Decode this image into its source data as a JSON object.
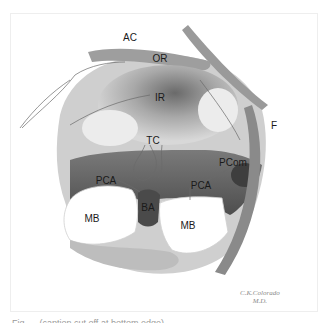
{
  "figure": {
    "type": "anatomical-illustration",
    "labels": [
      {
        "id": "AC",
        "text": "AC",
        "x": 130,
        "y": 38
      },
      {
        "id": "OR",
        "text": "OR",
        "x": 160,
        "y": 59
      },
      {
        "id": "IR",
        "text": "IR",
        "x": 160,
        "y": 98
      },
      {
        "id": "TC",
        "text": "TC",
        "x": 153,
        "y": 141
      },
      {
        "id": "F",
        "text": "F",
        "x": 274,
        "y": 126
      },
      {
        "id": "PCom",
        "text": "PCom",
        "x": 233,
        "y": 163
      },
      {
        "id": "PCA-left",
        "text": "PCA",
        "x": 106,
        "y": 181
      },
      {
        "id": "PCA-right",
        "text": "PCA",
        "x": 201,
        "y": 186
      },
      {
        "id": "BA",
        "text": "BA",
        "x": 148,
        "y": 208
      },
      {
        "id": "MB-left",
        "text": "MB",
        "x": 92,
        "y": 219
      },
      {
        "id": "MB-right",
        "text": "MB",
        "x": 188,
        "y": 226
      }
    ],
    "signature": {
      "line1": "C.K.Colorado",
      "line2": "M.D."
    },
    "caption_partial": "Fig. ... (caption cut off at bottom edge)",
    "colors": {
      "background": "#ffffff",
      "frame": "#eeeeee",
      "shade_dark": "#5a5a5a",
      "shade_mid": "#9a9a9a",
      "shade_light": "#d4d4d4"
    }
  }
}
